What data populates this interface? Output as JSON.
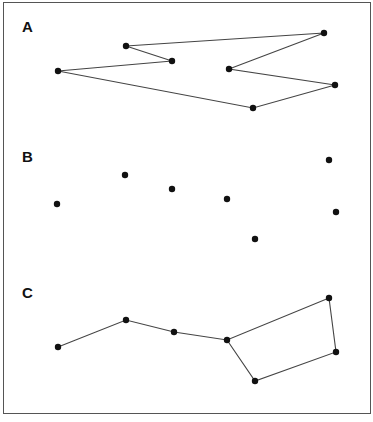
{
  "panels": [
    {
      "label": "A",
      "label_pos": [
        22,
        18
      ],
      "points": [
        [
          126,
          46
        ],
        [
          324,
          33
        ],
        [
          229,
          69
        ],
        [
          335,
          85
        ],
        [
          253,
          108
        ],
        [
          58,
          71
        ],
        [
          172,
          61
        ]
      ],
      "connections": "closed-path"
    },
    {
      "label": "B",
      "label_pos": [
        22,
        148
      ],
      "points": [
        [
          57,
          204
        ],
        [
          125,
          175
        ],
        [
          172,
          189
        ],
        [
          227,
          199
        ],
        [
          255,
          239
        ],
        [
          329,
          160
        ],
        [
          336,
          212
        ]
      ],
      "connections": "none"
    },
    {
      "label": "C",
      "label_pos": [
        22,
        284
      ],
      "points": [
        [
          58,
          347
        ],
        [
          126,
          320
        ],
        [
          174,
          332
        ],
        [
          227,
          340
        ],
        [
          329,
          298
        ],
        [
          336,
          352
        ],
        [
          255,
          381
        ]
      ],
      "path": [
        [
          58,
          347
        ],
        [
          126,
          320
        ],
        [
          174,
          332
        ],
        [
          227,
          340
        ],
        [
          329,
          298
        ],
        [
          336,
          352
        ],
        [
          255,
          381
        ],
        [
          227,
          340
        ]
      ],
      "connections": "open-path-with-loop"
    }
  ],
  "colors": {
    "line": "#444444",
    "dot": "#111111",
    "border": "#555555"
  }
}
